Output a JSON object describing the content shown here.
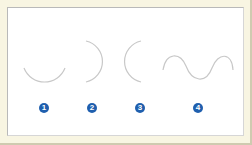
{
  "figure": {
    "background_color": "#f8f5e2",
    "panel_color": "#ffffff",
    "curve_color": "#c8c8c8",
    "badge_color": "#1f5fae",
    "items": [
      {
        "label": "1",
        "shape": "arc-opening-up"
      },
      {
        "label": "2",
        "shape": "arc-opening-left"
      },
      {
        "label": "3",
        "shape": "arc-opening-right"
      },
      {
        "label": "4",
        "shape": "s-wave"
      }
    ]
  }
}
